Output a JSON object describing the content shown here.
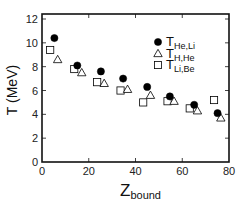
{
  "chart_data": {
    "type": "scatter",
    "title": "",
    "xlabel": "Z",
    "xlabel_sub": "bound",
    "ylabel": "T (MeV)",
    "xlim": [
      0,
      80
    ],
    "ylim": [
      0,
      12
    ],
    "xticks": [
      0,
      20,
      40,
      60,
      80
    ],
    "yticks": [
      0,
      2,
      4,
      6,
      8,
      10,
      12
    ],
    "grid": false,
    "legend_position": "upper right",
    "series": [
      {
        "name": "T_He,Li",
        "label_main": "T",
        "label_sub": "He,Li",
        "marker": "filled-circle",
        "x": [
          5.3,
          15.1,
          25.2,
          34.7,
          45.0,
          54.7,
          65.1,
          75.1
        ],
        "y": [
          10.4,
          8.1,
          7.6,
          7.0,
          6.3,
          5.5,
          4.8,
          4.1
        ]
      },
      {
        "name": "T_H,He",
        "label_main": "T",
        "label_sub": "H,He",
        "marker": "open-triangle",
        "x": [
          6.7,
          17.0,
          26.6,
          36.6,
          46.4,
          56.5,
          66.5,
          76.5
        ],
        "y": [
          8.6,
          7.5,
          6.6,
          6.1,
          5.6,
          5.1,
          4.3,
          3.7
        ]
      },
      {
        "name": "T_Li,Be",
        "label_main": "T",
        "label_sub": "Li,Be",
        "marker": "open-square",
        "x": [
          3.5,
          13.8,
          23.6,
          33.6,
          43.3,
          53.7,
          63.2,
          73.6
        ],
        "y": [
          9.4,
          7.8,
          6.7,
          6.0,
          5.0,
          5.1,
          4.5,
          5.2
        ]
      }
    ]
  },
  "colors": {
    "axis": "#111111",
    "marker": "#000000",
    "background": "#ffffff"
  }
}
